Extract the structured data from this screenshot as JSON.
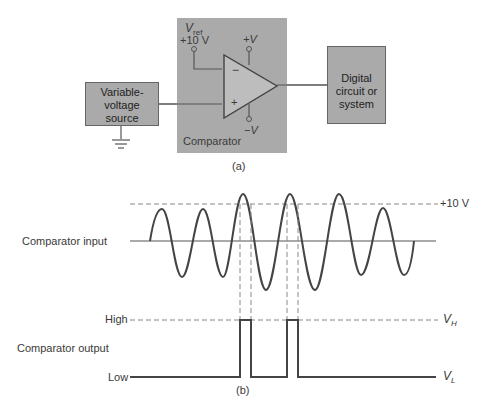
{
  "figure_a": {
    "source_box": {
      "label_lines": [
        "Variable-",
        "voltage",
        "source"
      ]
    },
    "comparator_box": {
      "label": "Comparator"
    },
    "vref": {
      "symbol": "V",
      "subscript": "ref",
      "value": "+10 V"
    },
    "supply_pos": "+V",
    "supply_neg": "−V",
    "input_minus": "−",
    "input_plus": "+",
    "digital_box": {
      "label_lines": [
        "Digital",
        "circuit or",
        "system"
      ]
    },
    "caption": "(a)"
  },
  "figure_b": {
    "input_label": "Comparator input",
    "threshold_label": "+10 V",
    "output_label": "Comparator output",
    "high_label": "High",
    "low_label": "Low",
    "vh_label": "V",
    "vh_sub": "H",
    "vl_label": "V",
    "vl_sub": "L",
    "caption": "(b)"
  },
  "colors": {
    "box_fill": "#aaaaaa",
    "line": "#444444",
    "dash": "#777777"
  }
}
